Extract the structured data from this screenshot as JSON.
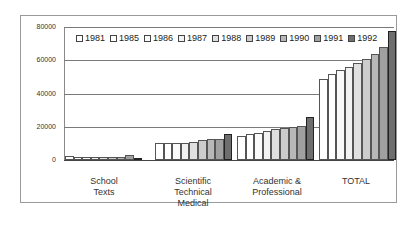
{
  "chart_data": {
    "type": "bar",
    "title": "",
    "xlabel": "",
    "ylabel": "",
    "ylim": [
      0,
      80000
    ],
    "yticks": [
      "0",
      "20000",
      "40000",
      "60000",
      "80000"
    ],
    "grid": true,
    "legend_position": "top-inside",
    "categories": [
      "School Texts",
      "Scientific Technical Medical",
      "Academic & Professional",
      "TOTAL"
    ],
    "category_lines": [
      [
        "School",
        "Texts"
      ],
      [
        "Scientific",
        "Technical",
        "Medical"
      ],
      [
        "Academic &",
        "Professional"
      ],
      [
        "TOTAL"
      ]
    ],
    "series": [
      {
        "name": "1981",
        "values": [
          2200,
          10200,
          14400,
          48600
        ]
      },
      {
        "name": "1985",
        "values": [
          1800,
          10200,
          15600,
          51600
        ]
      },
      {
        "name": "1986",
        "values": [
          1800,
          10200,
          16200,
          54000
        ]
      },
      {
        "name": "1987",
        "values": [
          1800,
          10200,
          17400,
          55800
        ]
      },
      {
        "name": "1988",
        "values": [
          2000,
          10800,
          18600,
          58200
        ]
      },
      {
        "name": "1989",
        "values": [
          2000,
          12000,
          19000,
          61000
        ]
      },
      {
        "name": "1990",
        "values": [
          2000,
          12600,
          19800,
          64000
        ]
      },
      {
        "name": "1991",
        "values": [
          2800,
          12600,
          20400,
          68000
        ]
      },
      {
        "name": "1992",
        "values": [
          1500,
          15600,
          25800,
          77500
        ]
      }
    ],
    "series_colors": [
      "#ffffff",
      "#ffffff",
      "#fafafa",
      "#f2f2f2",
      "#e0e0e0",
      "#cccccc",
      "#b8b8b8",
      "#a0a0a0",
      "#6e6e6e"
    ]
  }
}
